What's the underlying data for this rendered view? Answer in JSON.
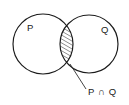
{
  "figure": {
    "type": "venn-diagram",
    "background_color": "#ffffff",
    "stroke_color": "#1a1a1a",
    "leader_color": "#3a3a3a"
  },
  "sets": [
    {
      "id": "left-set",
      "label": "P",
      "label_x": 27,
      "label_y": 31,
      "center_x": 43,
      "center_y": 44,
      "radius": 30
    },
    {
      "id": "right-set",
      "label": "Q",
      "label_x": 101,
      "label_y": 33,
      "center_x": 89,
      "center_y": 44,
      "radius": 29
    }
  ],
  "intersection": {
    "label": "P ∩ Q",
    "label_x": 88,
    "label_y": 95,
    "hatch_angle_deg": 60,
    "hatch_spacing": 3.4,
    "leader_start_x": 70,
    "leader_start_y": 64,
    "leader_end_x": 86,
    "leader_end_y": 89
  }
}
